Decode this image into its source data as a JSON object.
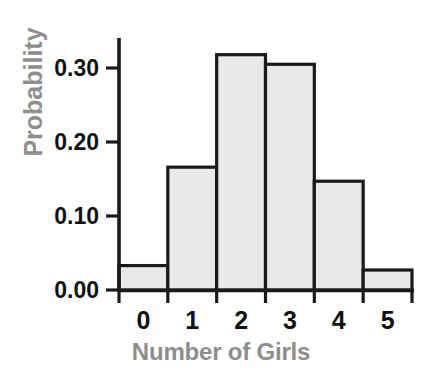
{
  "chart_data": {
    "type": "bar",
    "title": "",
    "subtitle": "",
    "xlabel": "Number of Girls",
    "ylabel": "Probability",
    "categories": [
      "0",
      "1",
      "2",
      "3",
      "4",
      "5"
    ],
    "values": [
      0.033,
      0.166,
      0.318,
      0.305,
      0.147,
      0.027
    ],
    "ylim": [
      0.0,
      0.34
    ],
    "xlim": [
      -0.5,
      5.5
    ],
    "ytick_labels": [
      "0.00",
      "0.10",
      "0.20",
      "0.30"
    ],
    "ytick_values": [
      0.0,
      0.1,
      0.2,
      0.3
    ],
    "xtick_labels": [
      "0",
      "1",
      "2",
      "3",
      "4",
      "5"
    ],
    "grid": false,
    "legend": false,
    "legend_position": "none",
    "bar_style": "histogram-adjacent",
    "annotations": []
  },
  "style": {
    "background": "#ffffff",
    "bar_fill": "#e9e9e9",
    "bar_edge": "#1a1a1a",
    "axis_color": "#1a1a1a",
    "tick_label_color": "#111111",
    "axis_title_color": "#8e8e8e"
  }
}
